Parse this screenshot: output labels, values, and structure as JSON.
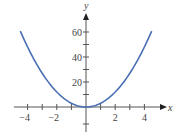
{
  "chart_data": {
    "type": "line",
    "title": "",
    "function": "y = 3x^2",
    "xlabel": "x",
    "ylabel": "y",
    "xlim": [
      -4.5,
      4.5
    ],
    "ylim": [
      -10,
      70
    ],
    "x_ticks": [
      -4,
      -3,
      -2,
      -1,
      0,
      1,
      2,
      3,
      4
    ],
    "x_tick_labels": [
      "-4",
      "-2",
      "2",
      "4"
    ],
    "x_tick_label_values": [
      -4,
      -2,
      2,
      4
    ],
    "y_ticks": [
      10,
      20,
      30,
      40,
      50,
      60
    ],
    "y_tick_labels": [
      "20",
      "40",
      "60"
    ],
    "y_tick_label_values": [
      20,
      40,
      60
    ],
    "grid": false,
    "legend": null,
    "series": [
      {
        "name": "y = 3x^2",
        "color": "#4a6fb5",
        "x": [
          -4.5,
          -4,
          -3,
          -2,
          -1,
          0,
          1,
          2,
          3,
          4,
          4.5
        ],
        "y": [
          60.75,
          48,
          27,
          12,
          3,
          0,
          3,
          12,
          27,
          48,
          60.75
        ]
      }
    ]
  },
  "colors": {
    "curve": "#4a6fb5",
    "axis": "#555555",
    "text": "#444444"
  }
}
